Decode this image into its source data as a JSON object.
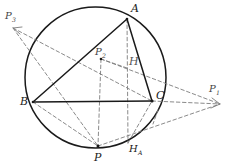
{
  "figure": {
    "type": "geometry-diagram",
    "background": "#ffffff",
    "stroke_solid": "#1a1a1a",
    "stroke_dashed": "#7d7d7d",
    "width": 230,
    "height": 167
  },
  "circle": {
    "name": "circumcircle",
    "cx": 95.5,
    "cy": 77.5,
    "r": 70.5
  },
  "points": {
    "A": {
      "label": "A",
      "sub": "",
      "x": 127,
      "y": 19,
      "lx": 131,
      "ly": 3
    },
    "B": {
      "label": "B",
      "sub": "",
      "x": 33,
      "y": 102,
      "lx": 20,
      "ly": 96
    },
    "C": {
      "label": "C",
      "sub": "",
      "x": 152,
      "y": 101,
      "lx": 156,
      "ly": 90
    },
    "H": {
      "label": "H",
      "sub": "",
      "x": 127,
      "y": 68,
      "lx": 129,
      "ly": 56
    },
    "P": {
      "label": "P",
      "sub": "",
      "x": 98,
      "y": 146,
      "lx": 94,
      "ly": 152
    },
    "HA": {
      "label": "H",
      "sub": "A",
      "x": 128,
      "y": 143,
      "lx": 129,
      "ly": 144
    },
    "P1": {
      "label": "P",
      "sub": "1",
      "x": 220,
      "y": 104,
      "lx": 209,
      "ly": 84
    },
    "P2": {
      "label": "P",
      "sub": "2",
      "x": 101,
      "y": 59,
      "lx": 95,
      "ly": 47
    },
    "P3": {
      "label": "P",
      "sub": "3",
      "x": 13,
      "y": 28,
      "lx": 5,
      "ly": 11
    }
  },
  "segments_solid": [
    {
      "name": "side-AB",
      "from": "A",
      "to": "B"
    },
    {
      "name": "side-BC",
      "from": "B",
      "to": "C"
    },
    {
      "name": "side-AC",
      "from": "A",
      "to": "C"
    }
  ],
  "segments_dashed": [
    {
      "name": "altitude-A-HA",
      "from": "A",
      "to": "HA"
    },
    {
      "name": "segment-P2-P",
      "from": "P2",
      "to": "P"
    },
    {
      "name": "segment-P3-C",
      "from": "P3",
      "to": "C"
    },
    {
      "name": "segment-P3-P",
      "from": "P3",
      "to": "P"
    },
    {
      "name": "segment-P2-P1",
      "from": "P2",
      "to": "P1"
    },
    {
      "name": "segment-B-P",
      "from": "B",
      "to": "P"
    },
    {
      "name": "segment-P-P1",
      "from": "P",
      "to": "P1"
    },
    {
      "name": "segment-C-P1",
      "from": "C",
      "to": "P1"
    },
    {
      "name": "segment-H-P2",
      "from": "H",
      "to": "P2"
    },
    {
      "name": "segment-HA-C",
      "from": "HA",
      "to": "C"
    }
  ],
  "ticks": [
    {
      "name": "perpendicular-tick-C",
      "x1": 158,
      "y1": 110,
      "x2": 153,
      "y2": 124
    }
  ],
  "arrowheads": [
    {
      "name": "arrowhead-P3",
      "at": "P3"
    },
    {
      "name": "arrowhead-P1",
      "at": "P1"
    }
  ]
}
